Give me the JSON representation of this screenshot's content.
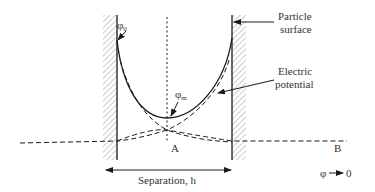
{
  "diagram": {
    "type": "electric-double-layer-overlap",
    "labels": {
      "phi_0": {
        "symbol": "φ",
        "subscript": "0"
      },
      "phi_m": {
        "symbol": "φ",
        "subscript": "m"
      },
      "particle_surface_line1": "Particle",
      "particle_surface_line2": "surface",
      "electric_potential_line1": "Electric",
      "electric_potential_line2": "potential",
      "point_a": "A",
      "point_b": "B",
      "separation": "Separation, h",
      "phi_to_zero_left": "φ",
      "phi_to_zero_right": "0"
    },
    "colors": {
      "line": "#1a1a1a",
      "hatch": "#9a9a9a",
      "text": "#333333"
    }
  }
}
